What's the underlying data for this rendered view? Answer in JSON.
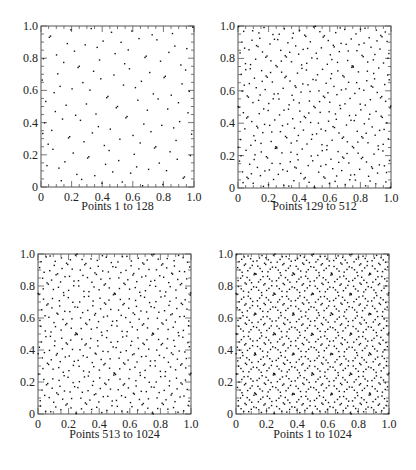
{
  "figure": {
    "panels": [
      {
        "caption": "Points 1 to 128",
        "start": 1,
        "end": 128,
        "frame": {
          "x": 41,
          "y": 26,
          "w": 153,
          "h": 161
        },
        "caption_y": 207
      },
      {
        "caption": "Points 129 to 512",
        "start": 129,
        "end": 512,
        "frame": {
          "x": 238,
          "y": 26,
          "w": 153,
          "h": 162
        },
        "caption_y": 207
      },
      {
        "caption": "Points 513 to 1024",
        "start": 513,
        "end": 1024,
        "frame": {
          "x": 38,
          "y": 254,
          "w": 153,
          "h": 160
        },
        "caption_y": 435
      },
      {
        "caption": "Points 1 to 1024",
        "start": 1,
        "end": 1024,
        "frame": {
          "x": 236,
          "y": 254,
          "w": 153,
          "h": 160
        },
        "caption_y": 435
      }
    ]
  },
  "chart_data": [
    {
      "type": "scatter",
      "title": "Points 1 to 128",
      "sequence": "sobol-2d",
      "index_range": [
        1,
        128
      ],
      "xlim": [
        0,
        1
      ],
      "ylim": [
        0,
        1
      ],
      "xticks": [
        "0",
        "0.2",
        "0.4",
        "0.6",
        "0.8",
        "1.0"
      ],
      "yticks": [
        "0",
        "0.2",
        "0.4",
        "0.6",
        "0.8",
        "1.0"
      ],
      "minor_tick_step": 0.05,
      "major_tick_step": 0.2,
      "grid": false,
      "legend": null
    },
    {
      "type": "scatter",
      "title": "Points 129 to 512",
      "sequence": "sobol-2d",
      "index_range": [
        129,
        512
      ],
      "xlim": [
        0,
        1
      ],
      "ylim": [
        0,
        1
      ],
      "xticks": [
        "0",
        "0.2",
        "0.4",
        "0.6",
        "0.8",
        "1.0"
      ],
      "yticks": [
        "0",
        "0.2",
        "0.4",
        "0.6",
        "0.8",
        "1.0"
      ],
      "minor_tick_step": 0.05,
      "major_tick_step": 0.2,
      "grid": false,
      "legend": null
    },
    {
      "type": "scatter",
      "title": "Points 513 to 1024",
      "sequence": "sobol-2d",
      "index_range": [
        513,
        1024
      ],
      "xlim": [
        0,
        1
      ],
      "ylim": [
        0,
        1
      ],
      "xticks": [
        "0",
        "0.2",
        "0.4",
        "0.6",
        "0.8",
        "1.0"
      ],
      "yticks": [
        "0",
        "0.2",
        "0.4",
        "0.6",
        "0.8",
        "1.0"
      ],
      "minor_tick_step": 0.05,
      "major_tick_step": 0.2,
      "grid": false,
      "legend": null
    },
    {
      "type": "scatter",
      "title": "Points 1 to 1024",
      "sequence": "sobol-2d",
      "index_range": [
        1,
        1024
      ],
      "xlim": [
        0,
        1
      ],
      "ylim": [
        0,
        1
      ],
      "xticks": [
        "0",
        "0.2",
        "0.4",
        "0.6",
        "0.8",
        "1.0"
      ],
      "yticks": [
        "0",
        "0.2",
        "0.4",
        "0.6",
        "0.8",
        "1.0"
      ],
      "minor_tick_step": 0.05,
      "major_tick_step": 0.2,
      "grid": false,
      "legend": null
    }
  ],
  "style": {
    "axis_color": "#555555",
    "point_color": "#111111",
    "text_color": "#222222"
  }
}
